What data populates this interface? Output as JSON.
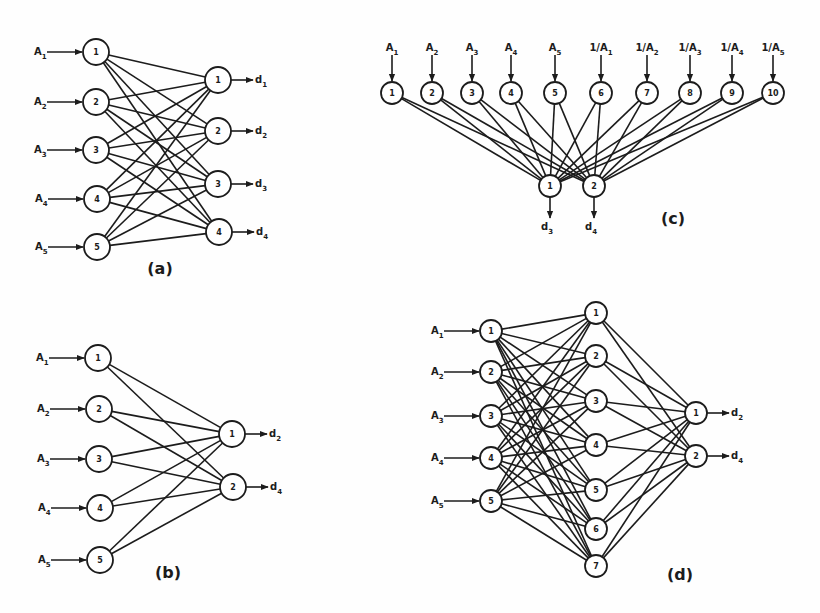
{
  "figure": {
    "panels": [
      {
        "id": "a",
        "caption": "(a)",
        "caption_pos": [
          160,
          274
        ],
        "orientation": "horizontal",
        "node_radius": 13,
        "inputs": [
          {
            "label": "1",
            "x": 96,
            "y": 52,
            "in": "A",
            "in_sub": "1"
          },
          {
            "label": "2",
            "x": 96,
            "y": 102,
            "in": "A",
            "in_sub": "2"
          },
          {
            "label": "3",
            "x": 96,
            "y": 150,
            "in": "A",
            "in_sub": "3"
          },
          {
            "label": "4",
            "x": 97,
            "y": 199,
            "in": "A",
            "in_sub": "4"
          },
          {
            "label": "5",
            "x": 97,
            "y": 247,
            "in": "A",
            "in_sub": "5"
          }
        ],
        "hidden": [],
        "outputs": [
          {
            "label": "1",
            "x": 218,
            "y": 80,
            "out": "d",
            "out_sub": "1"
          },
          {
            "label": "2",
            "x": 218,
            "y": 131,
            "out": "d",
            "out_sub": "2"
          },
          {
            "label": "3",
            "x": 218,
            "y": 184,
            "out": "d",
            "out_sub": "3"
          },
          {
            "label": "4",
            "x": 219,
            "y": 232,
            "out": "d",
            "out_sub": "4"
          }
        ]
      },
      {
        "id": "b",
        "caption": "(b)",
        "caption_pos": [
          168,
          578
        ],
        "orientation": "horizontal",
        "node_radius": 13,
        "inputs": [
          {
            "label": "1",
            "x": 98,
            "y": 358,
            "in": "A",
            "in_sub": "1"
          },
          {
            "label": "2",
            "x": 99,
            "y": 409,
            "in": "A",
            "in_sub": "2"
          },
          {
            "label": "3",
            "x": 99,
            "y": 459,
            "in": "A",
            "in_sub": "3"
          },
          {
            "label": "4",
            "x": 100,
            "y": 508,
            "in": "A",
            "in_sub": "4"
          },
          {
            "label": "5",
            "x": 100,
            "y": 560,
            "in": "A",
            "in_sub": "5"
          }
        ],
        "hidden": [],
        "outputs": [
          {
            "label": "1",
            "x": 232,
            "y": 434,
            "out": "d",
            "out_sub": "2"
          },
          {
            "label": "2",
            "x": 233,
            "y": 487,
            "out": "d",
            "out_sub": "4"
          }
        ]
      },
      {
        "id": "c",
        "caption": "(c)",
        "caption_pos": [
          673,
          224
        ],
        "orientation": "vertical",
        "node_radius": 11,
        "inputs": [
          {
            "label": "1",
            "x": 392,
            "y": 93,
            "in": "A",
            "in_sub": "1"
          },
          {
            "label": "2",
            "x": 432,
            "y": 93,
            "in": "A",
            "in_sub": "2"
          },
          {
            "label": "3",
            "x": 472,
            "y": 93,
            "in": "A",
            "in_sub": "3"
          },
          {
            "label": "4",
            "x": 511,
            "y": 93,
            "in": "A",
            "in_sub": "4"
          },
          {
            "label": "5",
            "x": 555,
            "y": 93,
            "in": "A",
            "in_sub": "5"
          },
          {
            "label": "6",
            "x": 601,
            "y": 93,
            "in": "1/A",
            "in_sub": "1"
          },
          {
            "label": "7",
            "x": 647,
            "y": 93,
            "in": "1/A",
            "in_sub": "2"
          },
          {
            "label": "8",
            "x": 690,
            "y": 93,
            "in": "1/A",
            "in_sub": "3"
          },
          {
            "label": "9",
            "x": 732,
            "y": 93,
            "in": "1/A",
            "in_sub": "4"
          },
          {
            "label": "10",
            "x": 773,
            "y": 93,
            "in": "1/A",
            "in_sub": "5"
          }
        ],
        "hidden": [],
        "outputs": [
          {
            "label": "1",
            "x": 550,
            "y": 186,
            "out": "d",
            "out_sub": "3"
          },
          {
            "label": "2",
            "x": 594,
            "y": 186,
            "out": "d",
            "out_sub": "4"
          }
        ]
      },
      {
        "id": "d",
        "caption": "(d)",
        "caption_pos": [
          680,
          580
        ],
        "orientation": "horizontal",
        "node_radius": 11,
        "inputs": [
          {
            "label": "1",
            "x": 491,
            "y": 331,
            "in": "A",
            "in_sub": "1"
          },
          {
            "label": "2",
            "x": 491,
            "y": 372,
            "in": "A",
            "in_sub": "2"
          },
          {
            "label": "3",
            "x": 491,
            "y": 416,
            "in": "A",
            "in_sub": "3"
          },
          {
            "label": "4",
            "x": 491,
            "y": 458,
            "in": "A",
            "in_sub": "4"
          },
          {
            "label": "5",
            "x": 491,
            "y": 501,
            "in": "A",
            "in_sub": "5"
          }
        ],
        "hidden": [
          {
            "label": "1",
            "x": 596,
            "y": 313
          },
          {
            "label": "2",
            "x": 596,
            "y": 356
          },
          {
            "label": "3",
            "x": 596,
            "y": 401
          },
          {
            "label": "4",
            "x": 596,
            "y": 445
          },
          {
            "label": "5",
            "x": 596,
            "y": 490
          },
          {
            "label": "6",
            "x": 596,
            "y": 529
          },
          {
            "label": "7",
            "x": 596,
            "y": 566
          }
        ],
        "outputs": [
          {
            "label": "1",
            "x": 696,
            "y": 413,
            "out": "d",
            "out_sub": "2"
          },
          {
            "label": "2",
            "x": 696,
            "y": 456,
            "out": "d",
            "out_sub": "4"
          }
        ]
      }
    ],
    "colors": {
      "ink": "#1c1c1c",
      "paper": "#fefefe"
    }
  }
}
